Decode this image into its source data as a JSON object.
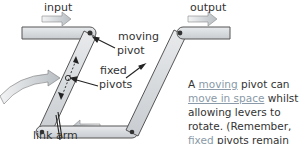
{
  "diagram": {
    "labels": {
      "input": "input",
      "output": "output",
      "moving_pivot_1": "moving",
      "moving_pivot_2": "pivot",
      "fixed_pivots_1": "fixed",
      "fixed_pivots_2": "pivots",
      "link_arm": "link arm"
    },
    "explanation": {
      "p1": "A ",
      "u1": "moving",
      "p2": " pivot can ",
      "u2": "move in space",
      "p3": " whilst allowing levers to rotate. (Remember, ",
      "u3": "fixed",
      "p4": " pivots remain ",
      "u4": "stationary",
      "p5": " in space.)"
    },
    "colors": {
      "bar_fill": "#d6dadd",
      "bar_stroke": "#555555",
      "arrow_fill": "#c9ced2",
      "underline_text": "#8a9aa8"
    }
  }
}
